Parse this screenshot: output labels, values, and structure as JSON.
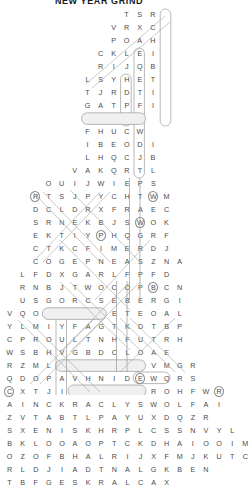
{
  "title": "NEW YEAR GRIND",
  "puzzle": {
    "type": "word-search",
    "shape": "staircase-triangle",
    "cell_size_px": 13.1,
    "row_height_px": 13,
    "rows": [
      {
        "top": 8,
        "left": 120,
        "letters": "T S R"
      },
      {
        "top": 21,
        "left": 107,
        "letters": "V R X C"
      },
      {
        "top": 34,
        "left": 107,
        "letters": "P O A H"
      },
      {
        "top": 47,
        "left": 94,
        "letters": "C K L E I"
      },
      {
        "top": 60,
        "left": 94,
        "letters": "R I J Q B"
      },
      {
        "top": 73,
        "left": 81,
        "letters": "L S Y H E T"
      },
      {
        "top": 86,
        "left": 81,
        "letters": "T J R D T I"
      },
      {
        "top": 99,
        "left": 81,
        "letters": "G A T P F I"
      },
      {
        "top": 112,
        "left": 81,
        "letters": "N I N T H"
      },
      {
        "top": 125,
        "left": 81,
        "letters": "F H U C W"
      },
      {
        "top": 138,
        "left": 81,
        "letters": "I B E O D I"
      },
      {
        "top": 151,
        "left": 81,
        "letters": "L H Q C J B"
      },
      {
        "top": 164,
        "left": 68,
        "letters": "V A K Q R T L"
      },
      {
        "top": 177,
        "left": 42,
        "letters": "O U I J W I E P S"
      },
      {
        "top": 190,
        "left": 29,
        "letters": "R T S J P Y C H T W M"
      },
      {
        "top": 203,
        "left": 29,
        "letters": "D C L D R X F R A E C"
      },
      {
        "top": 216,
        "left": 29,
        "letters": "S R N E K B J S W O K"
      },
      {
        "top": 229,
        "left": 29,
        "letters": "E K T I Y P H Q G R F"
      },
      {
        "top": 242,
        "left": 29,
        "letters": "C T K C F I M E R D J"
      },
      {
        "top": 255,
        "left": 29,
        "letters": "C O G E P N E A S Z N A"
      },
      {
        "top": 268,
        "left": 16,
        "letters": "L F D X G A R L F P F D"
      },
      {
        "top": 281,
        "left": 16,
        "letters": "R N B J T W O C O P B C N"
      },
      {
        "top": 294,
        "left": 16,
        "letters": "U S G O R C S E B E R G I"
      },
      {
        "top": 307,
        "left": 3,
        "letters": "V Q O N U X I S E T E O A L"
      },
      {
        "top": 320,
        "left": 3,
        "letters": "Y L M I Y F A G T K D T B P"
      },
      {
        "top": 333,
        "left": 3,
        "letters": "C P R O U L T N H F U T R H"
      },
      {
        "top": 346,
        "left": 3,
        "letters": "W S B H V G B D C L O A E"
      },
      {
        "top": 359,
        "left": 3,
        "letters": "R Z M L W E A T H E R V M G R"
      },
      {
        "top": 372,
        "left": 3,
        "letters": "Q D O P A V H N I D E W Q R S"
      },
      {
        "top": 385,
        "left": 3,
        "letters": "C X T J I I O M I Z E R O H F W R"
      }
    ],
    "extra_rows": [
      {
        "letters": "A I N C K R A C L Y S W O L F A I"
      },
      {
        "letters": "Z V T A B T L P A Y U X D Q Z R"
      },
      {
        "letters": "S X E N I S K H R P L C S S N V Y L"
      },
      {
        "letters": "B K L O O A O P T C K D H A I O O I M"
      },
      {
        "letters": "O Z O F B H A L R I J X F M J K U T C"
      },
      {
        "letters": "R L D J I A D T N A L G K B E N"
      },
      {
        "letters": "T B F G E S K R A L C A X"
      }
    ],
    "found_words": [
      "NINTH",
      "WEATHER",
      "CLARKS",
      "ZERO",
      "FLOWS",
      "NUXI"
    ]
  },
  "colors": {
    "letter": "#4a4a4a",
    "stroke": "#9a9a9a",
    "highlight_fill": "#f0f0f0",
    "title": "#1a1a1a"
  }
}
